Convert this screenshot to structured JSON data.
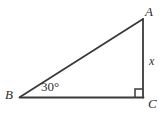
{
  "figure": {
    "kind": "right-triangle-geometry-diagram",
    "background_color": "#ffffff",
    "stroke_color": "#3a3a3a",
    "text_color": "#2f2f2f",
    "canvas": {
      "width": 165,
      "height": 115
    }
  },
  "vertices": {
    "A": {
      "label": "A",
      "x": 143,
      "y": 19
    },
    "B": {
      "label": "B",
      "x": 20,
      "y": 97
    },
    "C": {
      "label": "C",
      "x": 143,
      "y": 97
    }
  },
  "sides": {
    "hypotenuse": {
      "from": "B",
      "to": "A",
      "label": ""
    },
    "vertical": {
      "from": "A",
      "to": "C",
      "label": "x"
    },
    "base": {
      "from": "B",
      "to": "C",
      "label": ""
    }
  },
  "angles": {
    "at_B": {
      "label": "30°",
      "value": 30,
      "unit": "degrees"
    },
    "at_C": {
      "label": "",
      "value": 90,
      "unit": "degrees",
      "marker": "right-angle-square"
    }
  },
  "markers": {
    "right_angle_square": {
      "name": "right-angle-square",
      "size": 8,
      "corner_x": 135,
      "corner_y": 89
    }
  }
}
